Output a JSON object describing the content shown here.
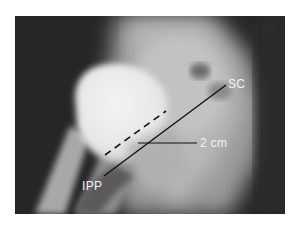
{
  "figure": {
    "type": "radiograph",
    "annotations": {
      "superior_label": "SC",
      "inferior_label": "IPP",
      "measurement_label": "2 cm"
    }
  }
}
